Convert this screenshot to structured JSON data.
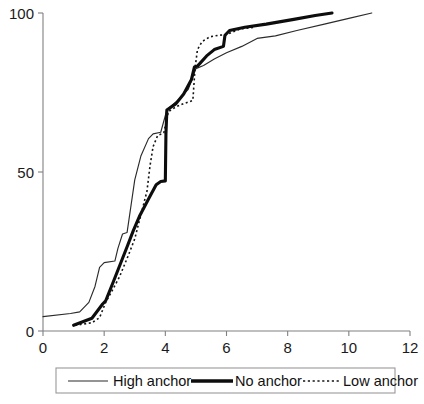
{
  "chart_data": {
    "type": "line",
    "title": "",
    "subtitle": "",
    "xlabel": "",
    "ylabel": "",
    "xlim": [
      0,
      12
    ],
    "ylim": [
      0,
      100
    ],
    "xticks": [
      0,
      2,
      4,
      6,
      8,
      10,
      12
    ],
    "yticks": [
      0,
      50,
      100
    ],
    "xtick_labels": [
      "0",
      "2",
      "4",
      "6",
      "8",
      "10",
      "12"
    ],
    "ytick_labels": [
      "0",
      "50",
      "100"
    ],
    "grid": false,
    "legend_position": "bottom",
    "annotations": [],
    "series": [
      {
        "name": "High anchor",
        "style": "thin-solid",
        "color": "#2b2b2b",
        "points": [
          [
            0.0,
            4.5
          ],
          [
            0.9,
            5.5
          ],
          [
            1.2,
            6.0
          ],
          [
            1.5,
            9.0
          ],
          [
            1.7,
            14.0
          ],
          [
            1.85,
            20.0
          ],
          [
            2.0,
            21.5
          ],
          [
            2.35,
            22.0
          ],
          [
            2.45,
            26.0
          ],
          [
            2.6,
            30.5
          ],
          [
            2.75,
            31.0
          ],
          [
            3.0,
            47.5
          ],
          [
            3.2,
            55.0
          ],
          [
            3.45,
            60.5
          ],
          [
            3.6,
            62.0
          ],
          [
            3.85,
            62.5
          ],
          [
            4.05,
            69.5
          ],
          [
            4.4,
            72.5
          ],
          [
            4.75,
            76.0
          ],
          [
            5.0,
            82.5
          ],
          [
            5.25,
            83.5
          ],
          [
            5.6,
            85.5
          ],
          [
            6.0,
            87.5
          ],
          [
            6.5,
            89.5
          ],
          [
            7.0,
            92.0
          ],
          [
            7.6,
            92.8
          ],
          [
            8.3,
            94.5
          ],
          [
            9.2,
            96.5
          ],
          [
            10.0,
            98.3
          ],
          [
            10.75,
            100.0
          ]
        ]
      },
      {
        "name": "No anchor",
        "style": "thick-solid",
        "color": "#0d0d0d",
        "points": [
          [
            1.0,
            1.8
          ],
          [
            1.6,
            4.0
          ],
          [
            1.95,
            8.5
          ],
          [
            2.05,
            9.5
          ],
          [
            2.3,
            15.5
          ],
          [
            2.75,
            26.5
          ],
          [
            2.95,
            31.5
          ],
          [
            3.15,
            36.0
          ],
          [
            3.45,
            41.5
          ],
          [
            3.7,
            46.0
          ],
          [
            3.85,
            47.0
          ],
          [
            4.0,
            47.2
          ],
          [
            4.02,
            62.0
          ],
          [
            4.05,
            69.5
          ],
          [
            4.35,
            71.5
          ],
          [
            4.6,
            74.5
          ],
          [
            4.85,
            79.0
          ],
          [
            4.95,
            83.0
          ],
          [
            5.05,
            83.3
          ],
          [
            5.35,
            86.5
          ],
          [
            5.6,
            88.5
          ],
          [
            5.9,
            89.5
          ],
          [
            5.95,
            93.0
          ],
          [
            6.1,
            94.5
          ],
          [
            6.6,
            95.5
          ],
          [
            7.3,
            96.5
          ],
          [
            8.2,
            98.0
          ],
          [
            8.9,
            99.2
          ],
          [
            9.45,
            100.0
          ]
        ]
      },
      {
        "name": "Low anchor",
        "style": "dotted",
        "color": "#141414",
        "points": [
          [
            1.05,
            1.8
          ],
          [
            1.6,
            2.6
          ],
          [
            1.85,
            4.2
          ],
          [
            2.05,
            9.0
          ],
          [
            2.25,
            12.5
          ],
          [
            2.5,
            17.0
          ],
          [
            2.8,
            24.0
          ],
          [
            3.0,
            29.0
          ],
          [
            3.2,
            36.5
          ],
          [
            3.4,
            44.0
          ],
          [
            3.5,
            52.0
          ],
          [
            3.6,
            58.0
          ],
          [
            3.75,
            61.5
          ],
          [
            3.95,
            62.3
          ],
          [
            4.1,
            69.0
          ],
          [
            4.35,
            70.5
          ],
          [
            4.6,
            71.5
          ],
          [
            4.9,
            72.5
          ],
          [
            4.97,
            82.5
          ],
          [
            5.05,
            88.5
          ],
          [
            5.2,
            91.0
          ],
          [
            5.45,
            92.5
          ],
          [
            5.75,
            93.0
          ],
          [
            6.0,
            93.2
          ],
          [
            6.45,
            95.0
          ],
          [
            6.9,
            95.5
          ]
        ]
      }
    ]
  },
  "legend": {
    "entries": [
      {
        "label": "High anchor",
        "swatch": "thin-solid-swatch"
      },
      {
        "label": "No anchor",
        "swatch": "thick-solid-swatch"
      },
      {
        "label": "Low anchor",
        "swatch": "dotted-swatch"
      }
    ]
  },
  "axes": {
    "x_axis_name": "x-axis",
    "y_axis_name": "y-axis"
  }
}
